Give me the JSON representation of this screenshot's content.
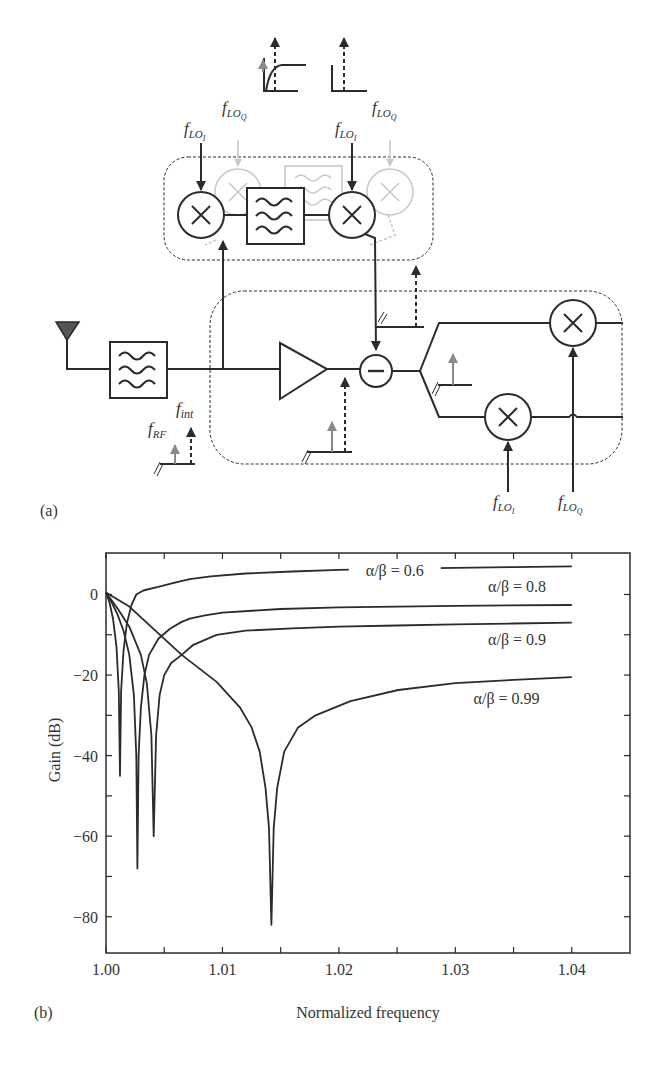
{
  "panel_a": {
    "label": "(a)",
    "signals": {
      "f_lo_i": {
        "base": "f",
        "sub": "LO",
        "subsub": "I"
      },
      "f_lo_q": {
        "base": "f",
        "sub": "LO",
        "subsub": "Q"
      },
      "f_int": {
        "base": "f",
        "sub": "int"
      },
      "f_rf": {
        "base": "f",
        "sub": "RF"
      }
    },
    "blocks": [
      "antenna",
      "bandpass-filter",
      "lna-amplifier",
      "subtractor",
      "mixer-i",
      "mixer-q",
      "feedforward-mixer-1",
      "feedforward-filter",
      "feedforward-mixer-2"
    ],
    "colors": {
      "line": "#2b2b2b",
      "ghost": "#c8c8c8",
      "grey_arrow": "#8a8a8a",
      "antenna": "#555555"
    }
  },
  "panel_b": {
    "label": "(b)"
  },
  "chart_data": {
    "type": "line",
    "title": "",
    "xlabel": "Normalized frequency",
    "ylabel": "Gain (dB)",
    "xlim": [
      1.0,
      1.045
    ],
    "ylim": [
      -89,
      10.3
    ],
    "x_ticks": [
      1.0,
      1.01,
      1.02,
      1.03,
      1.04
    ],
    "x_tick_labels": [
      "1.00",
      "1.01",
      "1.02",
      "1.03",
      "1.04"
    ],
    "x_minor_ticks": [
      1.005,
      1.015,
      1.025,
      1.035
    ],
    "y_ticks": [
      0,
      -20,
      -40,
      -60,
      -80
    ],
    "y_tick_labels": [
      "0",
      "−20",
      "−40",
      "−60",
      "−80"
    ],
    "y_minor_ticks": [
      -10,
      -30,
      -50,
      -70
    ],
    "grid": false,
    "legend": "inline labels",
    "series": [
      {
        "name": "α/β = 0.6",
        "notch": {
          "x": 1.0012,
          "y": -45
        },
        "x": [
          1.0,
          1.0003,
          1.0006,
          1.0009,
          1.0011,
          1.0012,
          1.0013,
          1.0015,
          1.0018,
          1.0022,
          1.0026,
          1.0032,
          1.0044,
          1.006,
          1.0072,
          1.009,
          1.012,
          1.016,
          1.02,
          1.025,
          1.03,
          1.035,
          1.04
        ],
        "y": [
          0.5,
          -2,
          -6,
          -13,
          -24,
          -45,
          -24,
          -14,
          -7,
          -2.5,
          0,
          1,
          1.8,
          3,
          3.8,
          4.5,
          5.2,
          5.7,
          6.1,
          6.4,
          6.6,
          6.8,
          7
        ]
      },
      {
        "name": "α/β = 0.8",
        "notch": {
          "x": 1.0027,
          "y": -68
        },
        "x": [
          1.0,
          1.0005,
          1.001,
          1.0015,
          1.002,
          1.0024,
          1.0026,
          1.0027,
          1.0028,
          1.003,
          1.0033,
          1.0037,
          1.0045,
          1.0055,
          1.0065,
          1.0072,
          1.0085,
          1.01,
          1.015,
          1.02,
          1.03,
          1.04
        ],
        "y": [
          0.5,
          -2,
          -5,
          -9,
          -15,
          -25,
          -40,
          -68,
          -40,
          -28,
          -20,
          -15,
          -11,
          -8.5,
          -6.8,
          -6,
          -5.2,
          -4.5,
          -3.6,
          -3.2,
          -2.8,
          -2.6
        ]
      },
      {
        "name": "α/β = 0.9",
        "notch": {
          "x": 1.0041,
          "y": -60
        },
        "x": [
          1.0,
          1.0005,
          1.001,
          1.002,
          1.003,
          1.0035,
          1.0039,
          1.0041,
          1.0043,
          1.0046,
          1.005,
          1.0056,
          1.0065,
          1.0075,
          1.0095,
          1.012,
          1.016,
          1.02,
          1.025,
          1.03,
          1.035,
          1.04
        ],
        "y": [
          0.5,
          -1.5,
          -3.5,
          -8,
          -15,
          -22,
          -35,
          -60,
          -35,
          -25,
          -20,
          -17,
          -15,
          -12.5,
          -10,
          -9,
          -8.4,
          -8,
          -7.7,
          -7.4,
          -7.2,
          -7
        ]
      },
      {
        "name": "α/β = 0.99",
        "notch": {
          "x": 1.0142,
          "y": -82
        },
        "x": [
          1.0,
          1.002,
          1.0038,
          1.0065,
          1.0095,
          1.0115,
          1.0125,
          1.0132,
          1.0137,
          1.014,
          1.0142,
          1.0144,
          1.0147,
          1.0153,
          1.0165,
          1.018,
          1.021,
          1.0251,
          1.03,
          1.035,
          1.04
        ],
        "y": [
          0.5,
          -3,
          -7.8,
          -15,
          -21.7,
          -28,
          -33,
          -39,
          -48,
          -58,
          -82,
          -58,
          -48,
          -39,
          -33,
          -30,
          -26.5,
          -23.7,
          -22,
          -21.2,
          -20.5
        ]
      }
    ],
    "annotations": [
      {
        "text": "α/β = 0.6",
        "x": 1.0248,
        "y": 4.5
      },
      {
        "text": "α/β = 0.8",
        "x": 1.0353,
        "y": 0.5
      },
      {
        "text": "α/β = 0.9",
        "x": 1.0353,
        "y": -12.6
      },
      {
        "text": "α/β = 0.99",
        "x": 1.0344,
        "y": -27.3
      }
    ]
  }
}
